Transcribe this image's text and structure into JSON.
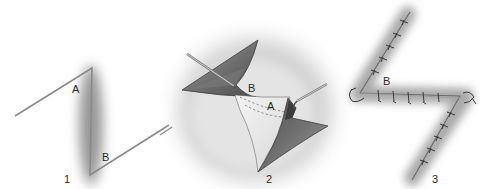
{
  "diagram": {
    "panels": [
      {
        "number": "1",
        "caption": "Incision design",
        "flap_labels": [
          "A",
          "B"
        ]
      },
      {
        "number": "2",
        "caption": "Flaps elevated and transposed with hooks",
        "flap_labels": [
          "B",
          "A"
        ]
      },
      {
        "number": "3",
        "caption": "Flaps sutured in transposed position",
        "flap_labels": [
          "B"
        ]
      }
    ],
    "colors": {
      "incision_line": "#8a8a8a",
      "shadow": "#9a9a9a",
      "flap_dark": "#5c5c5c",
      "flap_mid": "#8c8c8c",
      "skin_light": "#e6e6e6",
      "hook": "#7a7a7a",
      "suture": "#3a3a3a"
    }
  }
}
